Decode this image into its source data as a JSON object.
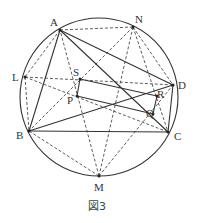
{
  "figure": {
    "caption": "図3",
    "circle": {
      "cx": 99,
      "cy": 97,
      "r": 79
    },
    "points": {
      "A": {
        "x": 60,
        "y": 30,
        "label": "A",
        "lx": 50,
        "ly": 26
      },
      "N": {
        "x": 133,
        "y": 27,
        "label": "N",
        "lx": 135,
        "ly": 23
      },
      "L": {
        "x": 25,
        "y": 77,
        "label": "L",
        "lx": 12,
        "ly": 81
      },
      "D": {
        "x": 173,
        "y": 85,
        "label": "D",
        "lx": 178,
        "ly": 89
      },
      "B": {
        "x": 29,
        "y": 131,
        "label": "B",
        "lx": 16,
        "ly": 139
      },
      "C": {
        "x": 168,
        "y": 132,
        "label": "C",
        "lx": 174,
        "ly": 140
      },
      "M": {
        "x": 99,
        "y": 176,
        "label": "M",
        "lx": 94,
        "ly": 191
      },
      "S": {
        "x": 80,
        "y": 79,
        "label": "S",
        "lx": 73,
        "ly": 76
      },
      "P": {
        "x": 77,
        "y": 96,
        "label": "P",
        "lx": 67,
        "ly": 104
      },
      "R": {
        "x": 157,
        "y": 96,
        "label": "R",
        "lx": 157,
        "ly": 98
      },
      "Q": {
        "x": 153,
        "y": 114,
        "label": "Q",
        "lx": 146,
        "ly": 117
      }
    },
    "solid_segments": [
      [
        "A",
        "B"
      ],
      [
        "A",
        "C"
      ],
      [
        "A",
        "D"
      ],
      [
        "B",
        "C"
      ],
      [
        "B",
        "D"
      ],
      [
        "C",
        "D"
      ],
      [
        "P",
        "Q"
      ],
      [
        "Q",
        "R"
      ],
      [
        "R",
        "S"
      ],
      [
        "S",
        "P"
      ]
    ],
    "dashed_segments": [
      [
        "A",
        "N"
      ],
      [
        "A",
        "L"
      ],
      [
        "L",
        "B"
      ],
      [
        "L",
        "D"
      ],
      [
        "L",
        "C"
      ],
      [
        "N",
        "B"
      ],
      [
        "N",
        "D"
      ],
      [
        "N",
        "C"
      ],
      [
        "N",
        "M"
      ],
      [
        "M",
        "A"
      ],
      [
        "M",
        "D"
      ],
      [
        "M",
        "B"
      ]
    ]
  }
}
